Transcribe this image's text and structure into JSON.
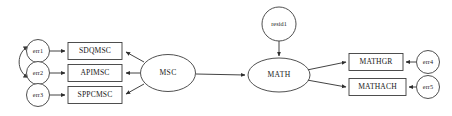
{
  "diagram": {
    "type": "structural-equation-model-path-diagram",
    "background_color": "#ffffff",
    "stroke_color": "#2e2e2e",
    "canvas": {
      "width": 452,
      "height": 116
    },
    "latent_variables": [
      {
        "id": "MSC",
        "label": "MSC",
        "shape": "ellipse",
        "cx": 168,
        "cy": 73,
        "rx": 27.5,
        "ry": 18.5
      },
      {
        "id": "MATH",
        "label": "MATH",
        "shape": "ellipse",
        "cx": 279,
        "cy": 75,
        "rx": 31,
        "ry": 17
      }
    ],
    "observed_variables": [
      {
        "id": "SDQMSC",
        "label": "SDQMSC",
        "shape": "rect",
        "x": 68,
        "y": 42,
        "w": 54,
        "h": 17
      },
      {
        "id": "APIMSC",
        "label": "APIMSC",
        "shape": "rect",
        "x": 68,
        "y": 64,
        "w": 54,
        "h": 17
      },
      {
        "id": "SPPCMSC",
        "label": "SPPCMSC",
        "shape": "rect",
        "x": 68,
        "y": 86,
        "w": 54,
        "h": 17
      },
      {
        "id": "MATHGR",
        "label": "MATHGR",
        "shape": "rect",
        "x": 349,
        "y": 53,
        "w": 54,
        "h": 17
      },
      {
        "id": "MATHACH",
        "label": "MATHACH",
        "shape": "rect",
        "x": 349,
        "y": 78,
        "w": 57,
        "h": 17
      }
    ],
    "residual_variables": [
      {
        "id": "err1",
        "label": "err1",
        "shape": "circle",
        "cx": 38,
        "cy": 51,
        "r": 11.5
      },
      {
        "id": "err2",
        "label": "err2",
        "shape": "circle",
        "cx": 38,
        "cy": 73,
        "r": 11.5
      },
      {
        "id": "err3",
        "label": "err3",
        "shape": "circle",
        "cx": 38,
        "cy": 95,
        "r": 11.5
      },
      {
        "id": "err4",
        "label": "err4",
        "shape": "circle",
        "cx": 428,
        "cy": 62,
        "r": 11.5
      },
      {
        "id": "err5",
        "label": "err5",
        "shape": "circle",
        "cx": 428,
        "cy": 87,
        "r": 11.5
      },
      {
        "id": "resid1",
        "label": "resid1",
        "shape": "circle",
        "cx": 279,
        "cy": 24,
        "r": 17
      }
    ],
    "directed_edges": [
      {
        "from": "err1",
        "to": "SDQMSC"
      },
      {
        "from": "err2",
        "to": "APIMSC"
      },
      {
        "from": "err3",
        "to": "SPPCMSC"
      },
      {
        "from": "MSC",
        "to": "SDQMSC"
      },
      {
        "from": "MSC",
        "to": "APIMSC"
      },
      {
        "from": "MSC",
        "to": "SPPCMSC"
      },
      {
        "from": "MSC",
        "to": "MATH"
      },
      {
        "from": "resid1",
        "to": "MATH"
      },
      {
        "from": "MATH",
        "to": "MATHGR"
      },
      {
        "from": "MATH",
        "to": "MATHACH"
      },
      {
        "from": "err4",
        "to": "MATHGR"
      },
      {
        "from": "err5",
        "to": "MATHACH"
      }
    ],
    "covariance_edges": [
      {
        "between": [
          "err1",
          "err2"
        ],
        "style": "double-headed-curve"
      }
    ]
  }
}
